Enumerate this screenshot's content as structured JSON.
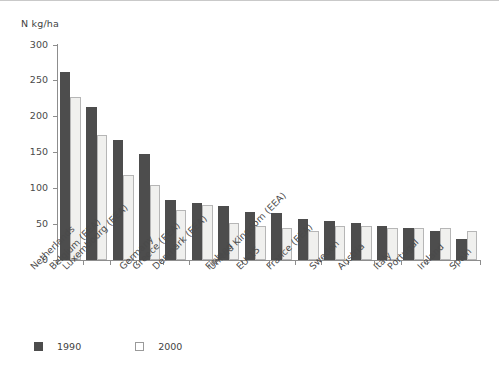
{
  "chart_data": {
    "type": "bar",
    "title": "",
    "subtitle": "",
    "xlabel": "",
    "ylabel": "N kg/ha",
    "ylim": [
      0,
      300
    ],
    "yticks": [
      0,
      50,
      100,
      150,
      200,
      250,
      300
    ],
    "ytick_labels": [
      "0",
      "50",
      "100",
      "150",
      "200",
      "250",
      "300"
    ],
    "grid": false,
    "legend_position": "bottom-left",
    "categories": [
      "Netherlands",
      "Belgium (EEA)",
      "Luxembourg (EEA)",
      "Germany",
      "Greece (EEA)",
      "Denmark (EEA)",
      "Finland",
      "EU-15",
      "United Kingdom (EEA)",
      "France (EEA)",
      "Sweden",
      "Austria",
      "Italy",
      "Portugal",
      "Ireland",
      "Spain"
    ],
    "series": [
      {
        "name": "1990",
        "color": "#4d4d4d",
        "values": [
          263,
          213,
          168,
          148,
          84,
          80,
          75,
          67,
          65,
          57,
          54,
          51,
          47,
          45,
          40,
          30
        ]
      },
      {
        "name": "2000",
        "color": "#f0f0ee",
        "values": [
          228,
          175,
          118,
          105,
          70,
          77,
          52,
          48,
          45,
          41,
          47,
          47,
          45,
          45,
          44,
          41
        ]
      }
    ]
  },
  "axis": {
    "unit_label": "N kg/ha"
  },
  "legend": {
    "items": [
      {
        "label": "1990"
      },
      {
        "label": "2000"
      }
    ]
  }
}
